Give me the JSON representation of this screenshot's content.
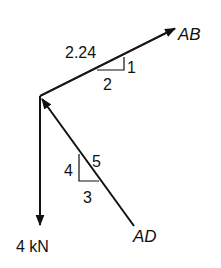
{
  "diagram": {
    "type": "free-body-diagram",
    "colors": {
      "line": "#111111",
      "background": "#ffffff"
    },
    "forces": [
      {
        "id": "AB",
        "label": "AB",
        "direction": "up-right",
        "slope": {
          "rise": "1",
          "run": "2",
          "hyp": "2.24"
        }
      },
      {
        "id": "AD",
        "label": "AD",
        "direction": "up-left (toward joint)",
        "slope": {
          "rise": "4",
          "run": "3",
          "hyp": "5"
        }
      },
      {
        "id": "load",
        "label": "4 kN",
        "direction": "down"
      }
    ],
    "labels": {
      "ab": "AB",
      "ad": "AD",
      "load": "4 kN",
      "ab_hyp": "2.24",
      "ab_rise": "1",
      "ab_run": "2",
      "ad_rise": "4",
      "ad_hyp": "5",
      "ad_run": "3"
    }
  }
}
